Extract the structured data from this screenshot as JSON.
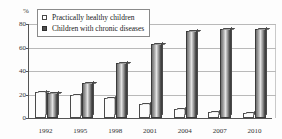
{
  "chart_data": {
    "type": "bar",
    "title": "",
    "xlabel": "",
    "ylabel": "%",
    "ylim": [
      0,
      80
    ],
    "yticks": [
      0,
      20,
      40,
      60,
      80
    ],
    "grid": true,
    "legend_position": "top-left",
    "categories": [
      "1992",
      "1995",
      "1998",
      "2001",
      "2004",
      "2007",
      "2010"
    ],
    "series": [
      {
        "name": "Practically healthy children",
        "marker": "hollow-square",
        "values": [
          22,
          20,
          17,
          12,
          8,
          5,
          4
        ]
      },
      {
        "name": "Children with chronic diseases",
        "marker": "filled-square",
        "values": [
          21,
          30,
          47,
          63,
          74,
          76,
          76
        ]
      }
    ]
  },
  "axis": {
    "percent_symbol": "%",
    "tick_labels": [
      "80",
      "60",
      "40",
      "20",
      "0"
    ]
  },
  "legend": {
    "items": [
      {
        "label": "Practically healthy children"
      },
      {
        "label": "Children with chronic diseases"
      }
    ]
  }
}
